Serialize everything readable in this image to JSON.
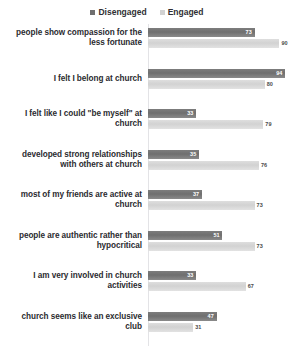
{
  "title_sliver": "",
  "legend": {
    "position": "top-center",
    "items": [
      {
        "label": "Disengaged",
        "color": "#6f6f6f",
        "icon": "square-swatch-icon"
      },
      {
        "label": "Engaged",
        "color": "#d2d2d2",
        "icon": "square-swatch-icon"
      }
    ]
  },
  "chart_data": {
    "type": "bar",
    "orientation": "horizontal",
    "title": "",
    "xlabel": "",
    "ylabel": "",
    "xlim": [
      0,
      100
    ],
    "grid": false,
    "legend_position": "top-center",
    "value_labels": true,
    "categories": [
      "people show compassion for the less fortunate",
      "I felt I belong at church",
      "I felt like I could \"be myself\" at church",
      "developed strong relationships with others at church",
      "most of my friends are active at church",
      "people are authentic rather than hypocritical",
      "I am very involved in church activities",
      "church seems like an exclusive club"
    ],
    "series": [
      {
        "name": "Disengaged",
        "color": "#6f6f6f",
        "values": [
          73,
          94,
          33,
          35,
          37,
          51,
          33,
          47
        ]
      },
      {
        "name": "Engaged",
        "color": "#d2d2d2",
        "values": [
          90,
          80,
          79,
          76,
          73,
          73,
          67,
          31
        ]
      }
    ]
  }
}
